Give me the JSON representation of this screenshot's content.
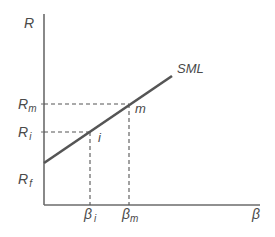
{
  "diagram": {
    "colors": {
      "axis": "#6b6b6b",
      "line": "#555555",
      "dashed": "#555555",
      "text": "#4a4a4a"
    },
    "y_axis": {
      "label": "R"
    },
    "x_axis": {
      "label": "β"
    },
    "line": {
      "label": "SML"
    },
    "y_ticks": [
      {
        "main": "R",
        "sub": "m"
      },
      {
        "main": "R",
        "sub": "i"
      },
      {
        "main": "R",
        "sub": "f"
      }
    ],
    "x_ticks": [
      {
        "main": "β",
        "sub": "i"
      },
      {
        "main": "β",
        "sub": "m"
      }
    ],
    "points": [
      {
        "label": "i"
      },
      {
        "label": "m"
      }
    ]
  }
}
